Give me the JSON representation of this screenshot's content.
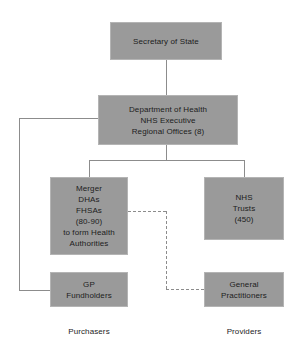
{
  "diagram": {
    "type": "organizational-flow-chart",
    "background_color": "#ffffff",
    "node_fill_color": "#9a9a9a",
    "line_color": "#8c8c8c",
    "text_color": "#1c1c1c"
  },
  "nodes": {
    "secretary": {
      "label": "Secretary of State"
    },
    "department_of_health": {
      "line1": "Department of Health",
      "line2": "NHS Executive",
      "line3": "Regional Offices (8)"
    },
    "merger": {
      "line1": "Merger",
      "line2": "DHAs",
      "line3": "FHSAs",
      "line4": "(80-90)",
      "line5": "to form Health",
      "line6": "Authorities"
    },
    "nhs_trusts": {
      "line1": "NHS",
      "line2": "Trusts",
      "line3": "(450)"
    },
    "gp_fundholders": {
      "line1": "GP",
      "line2": "Fundholders"
    },
    "general_practitioners": {
      "line1": "General",
      "line2": "Practitioners"
    }
  },
  "captions": {
    "purchasers": "Purchasers",
    "providers": "Providers"
  }
}
